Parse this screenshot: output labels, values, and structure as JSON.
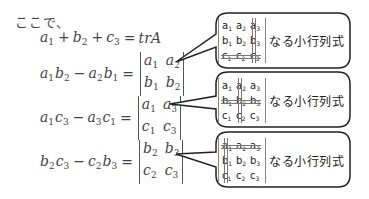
{
  "intro": "ここで、",
  "equations": [
    {
      "lhs": [
        {
          "v": "a",
          "s": "1"
        },
        {
          "op": "+"
        },
        {
          "v": "b",
          "s": "2"
        },
        {
          "op": "+"
        },
        {
          "v": "c",
          "s": "3"
        }
      ],
      "rhs_text": "trA"
    },
    {
      "lhs": [
        {
          "v": "a",
          "s": "1"
        },
        {
          "v": "b",
          "s": "2"
        },
        {
          "op": "−"
        },
        {
          "v": "a",
          "s": "2"
        },
        {
          "v": "b",
          "s": "1"
        }
      ],
      "det": [
        [
          "a",
          "1"
        ],
        [
          "a",
          "2"
        ],
        [
          "b",
          "1"
        ],
        [
          "b",
          "2"
        ]
      ]
    },
    {
      "lhs": [
        {
          "v": "a",
          "s": "1"
        },
        {
          "v": "c",
          "s": "3"
        },
        {
          "op": "−"
        },
        {
          "v": "a",
          "s": "3"
        },
        {
          "v": "c",
          "s": "1"
        }
      ],
      "det": [
        [
          "a",
          "1"
        ],
        [
          "a",
          "3"
        ],
        [
          "c",
          "1"
        ],
        [
          "c",
          "3"
        ]
      ]
    },
    {
      "lhs": [
        {
          "v": "b",
          "s": "2"
        },
        {
          "v": "c",
          "s": "3"
        },
        {
          "op": "−"
        },
        {
          "v": "c",
          "s": "2"
        },
        {
          "v": "b",
          "s": "3"
        }
      ],
      "det": [
        [
          "b",
          "2"
        ],
        [
          "b",
          "3"
        ],
        [
          "c",
          "2"
        ],
        [
          "c",
          "3"
        ]
      ]
    }
  ],
  "bubbles": [
    {
      "matrix": [
        [
          "a",
          "1"
        ],
        [
          "a",
          "2"
        ],
        [
          "a",
          "3"
        ],
        [
          "b",
          "1"
        ],
        [
          "b",
          "2"
        ],
        [
          "b",
          "3"
        ],
        [
          "c",
          "1"
        ],
        [
          "c",
          "2"
        ],
        [
          "c",
          "3"
        ]
      ],
      "struck_row": 3,
      "struck_col": 3,
      "label": "なる小行列式"
    },
    {
      "matrix": [
        [
          "a",
          "1"
        ],
        [
          "a",
          "2"
        ],
        [
          "a",
          "3"
        ],
        [
          "b",
          "1"
        ],
        [
          "b",
          "2"
        ],
        [
          "b",
          "3"
        ],
        [
          "c",
          "1"
        ],
        [
          "c",
          "2"
        ],
        [
          "c",
          "3"
        ]
      ],
      "struck_row": 2,
      "struck_col": 2,
      "label": "なる小行列式"
    },
    {
      "matrix": [
        [
          "a",
          "1"
        ],
        [
          "a",
          "2"
        ],
        [
          "a",
          "3"
        ],
        [
          "b",
          "1"
        ],
        [
          "b",
          "2"
        ],
        [
          "b",
          "3"
        ],
        [
          "c",
          "1"
        ],
        [
          "c",
          "2"
        ],
        [
          "c",
          "3"
        ]
      ],
      "struck_row": 1,
      "struck_col": 1,
      "label": "なる小行列式"
    }
  ],
  "colors": {
    "text": "#444444",
    "bubble_stroke": "#222222",
    "strike": "#777777"
  }
}
